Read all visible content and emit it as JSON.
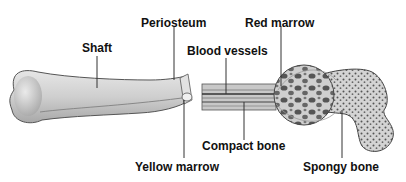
{
  "diagram": {
    "labels": {
      "shaft": "Shaft",
      "periosteum": "Periosteum",
      "red_marrow": "Red marrow",
      "blood_vessels": "Blood vessels",
      "compact_bone": "Compact bone",
      "yellow_marrow": "Yellow marrow",
      "spongy_bone": "Spongy bone"
    },
    "colors": {
      "bone_fill": "#d9d9d9",
      "bone_shade": "#9a9a9a",
      "outline": "#333333",
      "pore": "#555555",
      "text": "#111111"
    }
  }
}
